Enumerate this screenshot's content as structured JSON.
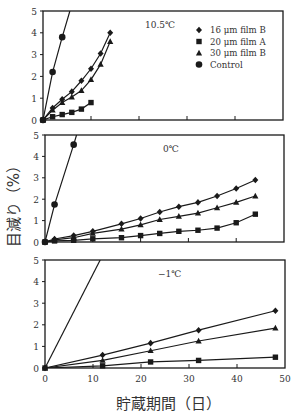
{
  "chart_data": [
    {
      "type": "line",
      "title": "10.5℃",
      "xlabel": "貯蔵期間（日）",
      "ylabel": "目減り（%）",
      "xlim": [
        0,
        50
      ],
      "ylim": [
        0,
        5
      ],
      "xticks": [
        0,
        10,
        20,
        30,
        40,
        50
      ],
      "yticks": [
        0,
        1,
        2,
        3,
        4,
        5
      ],
      "legend_position": "upper right",
      "series": [
        {
          "name": "16 μm film B",
          "marker": "diamond",
          "x": [
            0,
            2,
            4,
            6,
            8,
            10,
            12,
            14
          ],
          "values": [
            0,
            0.55,
            0.95,
            1.3,
            1.8,
            2.35,
            3.05,
            4.0
          ]
        },
        {
          "name": "20 μm film A",
          "marker": "square",
          "x": [
            0,
            2,
            4,
            6,
            8,
            10
          ],
          "values": [
            0,
            0.15,
            0.25,
            0.35,
            0.5,
            0.8
          ]
        },
        {
          "name": "30 μm film B",
          "marker": "triangle",
          "x": [
            0,
            2,
            4,
            6,
            8,
            10,
            12,
            14
          ],
          "values": [
            0,
            0.45,
            0.8,
            1.05,
            1.35,
            1.85,
            2.55,
            3.6
          ]
        },
        {
          "name": "Control",
          "marker": "circle",
          "x": [
            0,
            2,
            4
          ],
          "values": [
            0,
            2.2,
            3.8
          ],
          "extend_to": [
            5.6,
            5
          ]
        }
      ]
    },
    {
      "type": "line",
      "title": "0℃",
      "xlim": [
        0,
        50
      ],
      "ylim": [
        0,
        5
      ],
      "xticks": [
        0,
        10,
        20,
        30,
        40,
        50
      ],
      "yticks": [
        0,
        1,
        2,
        3,
        4,
        5
      ],
      "series": [
        {
          "name": "16 μm film B",
          "marker": "diamond",
          "x": [
            0,
            2,
            6,
            10,
            16,
            20,
            24,
            28,
            32,
            36,
            40,
            44
          ],
          "values": [
            0,
            0.14,
            0.3,
            0.5,
            0.85,
            1.1,
            1.4,
            1.65,
            1.85,
            2.15,
            2.5,
            2.9
          ]
        },
        {
          "name": "20 μm film A",
          "marker": "square",
          "x": [
            0,
            2,
            6,
            10,
            16,
            20,
            24,
            28,
            32,
            36,
            40,
            44
          ],
          "values": [
            0,
            0.05,
            0.08,
            0.15,
            0.2,
            0.3,
            0.4,
            0.5,
            0.55,
            0.65,
            0.9,
            1.3
          ]
        },
        {
          "name": "30 μm film B",
          "marker": "triangle",
          "x": [
            0,
            2,
            6,
            10,
            16,
            20,
            24,
            28,
            32,
            36,
            40,
            44
          ],
          "values": [
            0,
            0.1,
            0.2,
            0.4,
            0.6,
            0.8,
            1.05,
            1.2,
            1.35,
            1.6,
            1.85,
            2.15
          ]
        },
        {
          "name": "Control",
          "marker": "circle",
          "x": [
            0,
            2,
            6
          ],
          "values": [
            0,
            1.75,
            4.55
          ],
          "extend_to": [
            6.6,
            5
          ]
        }
      ]
    },
    {
      "type": "line",
      "title": "−1℃",
      "xlim": [
        0,
        50
      ],
      "ylim": [
        0,
        5
      ],
      "xticks": [
        0,
        10,
        20,
        30,
        40,
        50
      ],
      "yticks": [
        0,
        1,
        2,
        3,
        4,
        5
      ],
      "series": [
        {
          "name": "16 μm film B",
          "marker": "diamond",
          "x": [
            0,
            12,
            22,
            32,
            48
          ],
          "values": [
            0,
            0.6,
            1.15,
            1.75,
            2.65
          ]
        },
        {
          "name": "20 μm film A",
          "marker": "square",
          "x": [
            0,
            12,
            22,
            32,
            48
          ],
          "values": [
            0,
            0.1,
            0.28,
            0.35,
            0.5
          ]
        },
        {
          "name": "30 μm film B",
          "marker": "triangle",
          "x": [
            0,
            12,
            22,
            32,
            48
          ],
          "values": [
            0,
            0.35,
            0.8,
            1.25,
            1.85
          ]
        },
        {
          "name": "Control",
          "marker": "none",
          "x": [
            0,
            11.5
          ],
          "values": [
            0,
            5
          ]
        }
      ]
    }
  ],
  "axes": {
    "ylabel": "目減り（%）",
    "xlabel": "貯蔵期間（日）"
  }
}
